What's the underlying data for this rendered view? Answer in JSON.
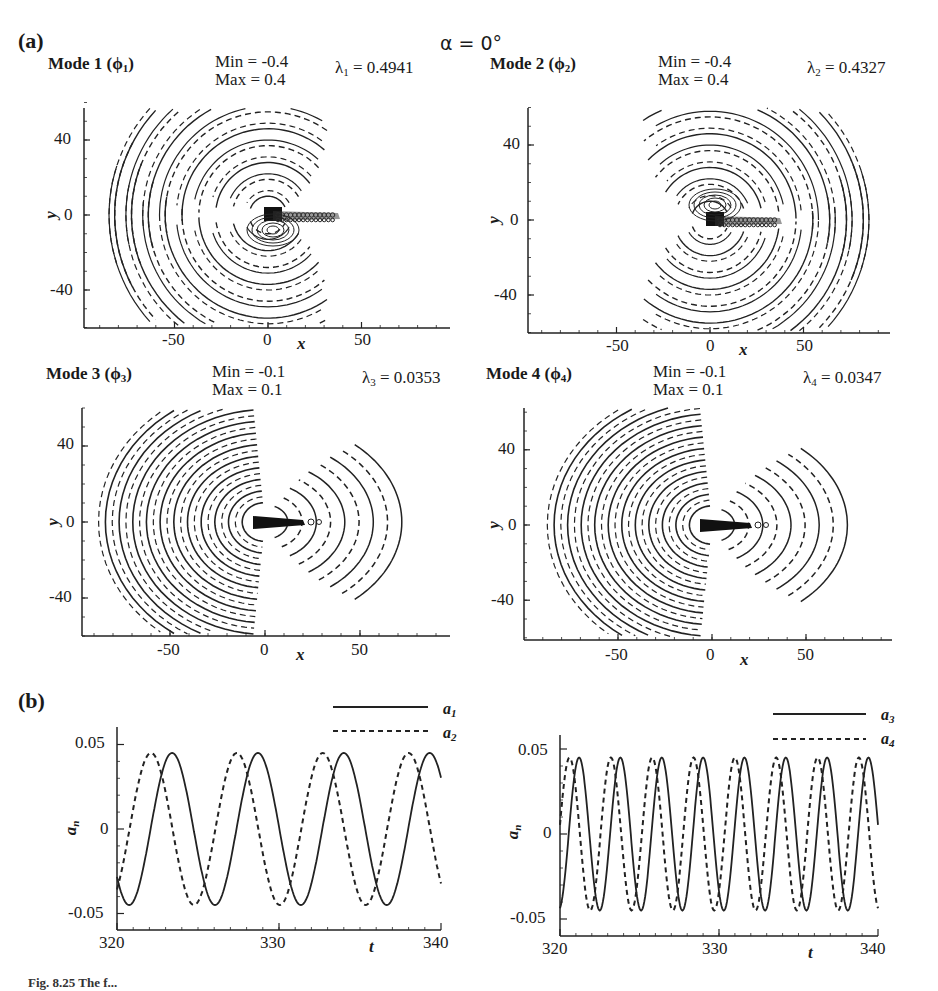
{
  "figure": {
    "panel_a_label": "(a)",
    "panel_b_label": "(b)",
    "alpha_label": "α = 0°",
    "caption_fragment": "Fig. 8.25  The f..."
  },
  "modes": [
    {
      "title": "Mode 1 (ϕ",
      "sub": "1",
      "title_end": ")",
      "min": "Min = -0.4",
      "max": "Max = 0.4",
      "lambda_sym": "λ",
      "lambda_sub": "1",
      "lambda_val": " = 0.4941"
    },
    {
      "title": "Mode 2 (ϕ",
      "sub": "2",
      "title_end": ")",
      "min": "Min = -0.4",
      "max": "Max = 0.4",
      "lambda_sym": "λ",
      "lambda_sub": "2",
      "lambda_val": " = 0.4327"
    },
    {
      "title": "Mode 3 (ϕ",
      "sub": "3",
      "title_end": ")",
      "min": "Min = -0.1",
      "max": "Max = 0.1",
      "lambda_sym": "λ",
      "lambda_sub": "3",
      "lambda_val": " = 0.0353"
    },
    {
      "title": "Mode 4 (ϕ",
      "sub": "4",
      "title_end": ")",
      "min": "Min = -0.1",
      "max": "Max = 0.1",
      "lambda_sym": "λ",
      "lambda_sub": "4",
      "lambda_val": " = 0.0347"
    }
  ],
  "contour_axes": {
    "xlabel": "x",
    "ylabel": "y",
    "xticks": [
      "-50",
      "0",
      "50"
    ],
    "yticks": [
      "40",
      "0",
      "-40"
    ]
  },
  "timeseries_axes": {
    "xlabel": "t",
    "ylabel": "a",
    "ylabel_sub": "n",
    "xticks": [
      "320",
      "330",
      "340"
    ],
    "yticks": [
      "0.05",
      "0",
      "-0.05"
    ]
  },
  "legends": {
    "left": [
      {
        "label": "a",
        "sub": "1",
        "style": "solid"
      },
      {
        "label": "a",
        "sub": "2",
        "style": "dashed"
      }
    ],
    "right": [
      {
        "label": "a",
        "sub": "3",
        "style": "solid"
      },
      {
        "label": "a",
        "sub": "4",
        "style": "dashed"
      }
    ]
  },
  "chart_data": [
    {
      "type": "heatmap",
      "title": "Mode 1 (φ1) contour, Min = -0.4, Max = 0.4, λ1 = 0.4941",
      "xlabel": "x",
      "ylabel": "y",
      "xlim": [
        -90,
        90
      ],
      "ylim": [
        -60,
        60
      ],
      "xticks": [
        -50,
        0,
        50
      ],
      "yticks": [
        -40,
        0,
        40
      ],
      "levels": {
        "min": -0.4,
        "max": 0.4,
        "negative_style": "dashed",
        "positive_style": "solid"
      },
      "pattern": "spiral arcs above and below centerline, wake at y=0 extending to x≈40"
    },
    {
      "type": "heatmap",
      "title": "Mode 2 (φ2) contour, Min = -0.4, Max = 0.4, λ2 = 0.4327",
      "xlabel": "x",
      "ylabel": "y",
      "xlim": [
        -90,
        90
      ],
      "ylim": [
        -60,
        60
      ],
      "xticks": [
        -50,
        0,
        50
      ],
      "yticks": [
        -40,
        0,
        40
      ],
      "levels": {
        "min": -0.4,
        "max": 0.4,
        "negative_style": "dashed",
        "positive_style": "solid"
      },
      "pattern": "spiral arcs above and below centerline, wake at y=0 extending to x≈40"
    },
    {
      "type": "heatmap",
      "title": "Mode 3 (φ3) contour, Min = -0.1, Max = 0.1, λ3 = 0.0353",
      "xlabel": "x",
      "ylabel": "y",
      "xlim": [
        -90,
        90
      ],
      "ylim": [
        -60,
        60
      ],
      "xticks": [
        -50,
        0,
        50
      ],
      "yticks": [
        -40,
        0,
        40
      ],
      "levels": {
        "min": -0.1,
        "max": 0.1,
        "negative_style": "dashed",
        "positive_style": "solid"
      },
      "pattern": "dense concentric arcs upstream (x<0), sparser arcs downstream (x>0)"
    },
    {
      "type": "heatmap",
      "title": "Mode 4 (φ4) contour, Min = -0.1, Max = 0.1, λ4 = 0.0347",
      "xlabel": "x",
      "ylabel": "y",
      "xlim": [
        -90,
        90
      ],
      "ylim": [
        -60,
        60
      ],
      "xticks": [
        -50,
        0,
        50
      ],
      "yticks": [
        -40,
        0,
        40
      ],
      "levels": {
        "min": -0.1,
        "max": 0.1,
        "negative_style": "dashed",
        "positive_style": "solid"
      },
      "pattern": "dense concentric arcs upstream (x<0), sparser arcs downstream (x>0)"
    },
    {
      "type": "line",
      "title": "Temporal coefficients a1, a2",
      "xlabel": "t",
      "ylabel": "a_n",
      "xlim": [
        320,
        340
      ],
      "ylim": [
        -0.06,
        0.06
      ],
      "xticks": [
        320,
        330,
        340
      ],
      "yticks": [
        -0.05,
        0,
        0.05
      ],
      "series": [
        {
          "name": "a1",
          "style": "solid",
          "amplitude": 0.045,
          "period": 5.3,
          "peaks_t": [
            323.4,
            328.7,
            334.0,
            339.2
          ],
          "troughs_t": [
            320.8,
            326.1,
            331.3,
            336.6
          ]
        },
        {
          "name": "a2",
          "style": "dashed",
          "amplitude": 0.045,
          "period": 5.3,
          "peaks_t": [
            322.1,
            327.4,
            332.7,
            337.9
          ],
          "troughs_t": [
            324.8,
            330.0,
            335.3,
            340.0
          ]
        }
      ]
    },
    {
      "type": "line",
      "title": "Temporal coefficients a3, a4",
      "xlabel": "t",
      "ylabel": "a_n",
      "xlim": [
        320,
        340
      ],
      "ylim": [
        -0.06,
        0.06
      ],
      "xticks": [
        320,
        330,
        340
      ],
      "yticks": [
        -0.05,
        0,
        0.05
      ],
      "series": [
        {
          "name": "a3",
          "style": "solid",
          "amplitude": 0.045,
          "period": 2.6,
          "cycles_visible": 8
        },
        {
          "name": "a4",
          "style": "dashed",
          "amplitude": 0.045,
          "period": 2.6,
          "cycles_visible": 8
        }
      ]
    }
  ]
}
